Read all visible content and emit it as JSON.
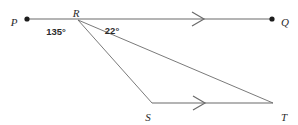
{
  "figure": {
    "type": "geometry-diagram",
    "background_color": "#ffffff",
    "line_color": "#6b6b6b",
    "label_color": "#2b2b2b",
    "dot_color": "#1d1d1d"
  },
  "points": [
    {
      "name": "P",
      "label": "P",
      "x": 27,
      "y": 19,
      "has_dot": true,
      "label_x": 14,
      "label_y": 22,
      "label_anchor": "middle"
    },
    {
      "name": "R",
      "label": "R",
      "x": 78,
      "y": 20,
      "has_dot": false,
      "label_x": 76,
      "label_y": 13,
      "label_anchor": "middle"
    },
    {
      "name": "Q",
      "label": "Q",
      "x": 272,
      "y": 19,
      "has_dot": true,
      "label_x": 285,
      "label_y": 22,
      "label_anchor": "middle"
    },
    {
      "name": "S",
      "label": "S",
      "x": 152,
      "y": 103,
      "has_dot": false,
      "label_x": 148,
      "label_y": 117,
      "label_anchor": "middle"
    },
    {
      "name": "T",
      "label": "T",
      "x": 273,
      "y": 103,
      "has_dot": false,
      "label_x": 284,
      "label_y": 117,
      "label_anchor": "middle"
    }
  ],
  "segments": [
    {
      "name": "line-PQ",
      "from": "P",
      "to": "Q",
      "x1": 27,
      "y1": 19,
      "x2": 272,
      "y2": 19
    },
    {
      "name": "line-ST",
      "from": "S",
      "to": "T",
      "x1": 152,
      "y1": 103,
      "x2": 273,
      "y2": 103
    },
    {
      "name": "ray-RT",
      "from": "R",
      "to": "T",
      "x1": 78,
      "y1": 20,
      "x2": 273,
      "y2": 103
    },
    {
      "name": "ray-RS",
      "from": "R",
      "to": "S",
      "x1": 78,
      "y1": 20,
      "x2": 152,
      "y2": 103
    }
  ],
  "chevrons": [
    {
      "name": "parallel-mark-pq",
      "x": 198,
      "y": 19,
      "on": "line-PQ"
    },
    {
      "name": "parallel-mark-st",
      "x": 199,
      "y": 103,
      "on": "line-ST"
    }
  ],
  "angles": [
    {
      "name": "angle-prs",
      "value": "135°",
      "vertex": "R",
      "x": 56,
      "y": 32,
      "between": [
        "P",
        "S"
      ]
    },
    {
      "name": "angle-trq",
      "value": "22°",
      "vertex": "R",
      "x": 112,
      "y": 31,
      "between": [
        "T",
        "Q"
      ]
    }
  ]
}
